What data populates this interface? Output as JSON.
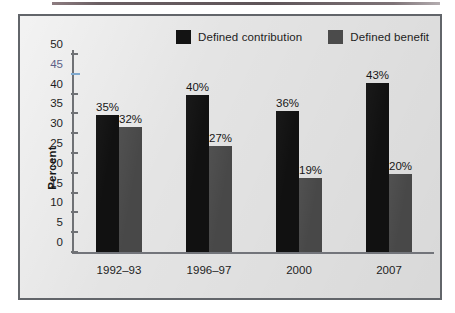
{
  "figure": {
    "background_color": "#e4e4e4",
    "frame_color": "#62656a"
  },
  "legend": {
    "position": "top-right",
    "entries": [
      {
        "label": "Defined contribution",
        "color": "#131313",
        "swatch_name": "legend-swatch-defined-contribution"
      },
      {
        "label": "Defined benefit",
        "color": "#4b4b4b",
        "swatch_name": "legend-swatch-defined-benefit"
      }
    ]
  },
  "axes": {
    "y_title": "Percent",
    "y_ticks": [
      "50",
      "45",
      "40",
      "35",
      "30",
      "25",
      "20",
      "15",
      "10",
      "5",
      "0"
    ],
    "x_ticks": [
      "1992–93",
      "1996–97",
      "2000",
      "2007"
    ]
  },
  "chart_data": {
    "type": "bar",
    "title": "",
    "xlabel": "",
    "ylabel": "Percent",
    "ylim": [
      0,
      50
    ],
    "ytick_step": 5,
    "grid": false,
    "legend_position": "top-right",
    "categories": [
      "1992–93",
      "1996–97",
      "2000",
      "2007"
    ],
    "series": [
      {
        "name": "Defined contribution",
        "color": "#111111",
        "values": [
          35,
          40,
          36,
          43
        ],
        "labels": [
          "35%",
          "40%",
          "36%",
          "43%"
        ]
      },
      {
        "name": "Defined benefit",
        "color": "#484848",
        "values": [
          32,
          27,
          19,
          20
        ],
        "labels": [
          "32%",
          "27%",
          "19%",
          "20%"
        ]
      }
    ]
  }
}
